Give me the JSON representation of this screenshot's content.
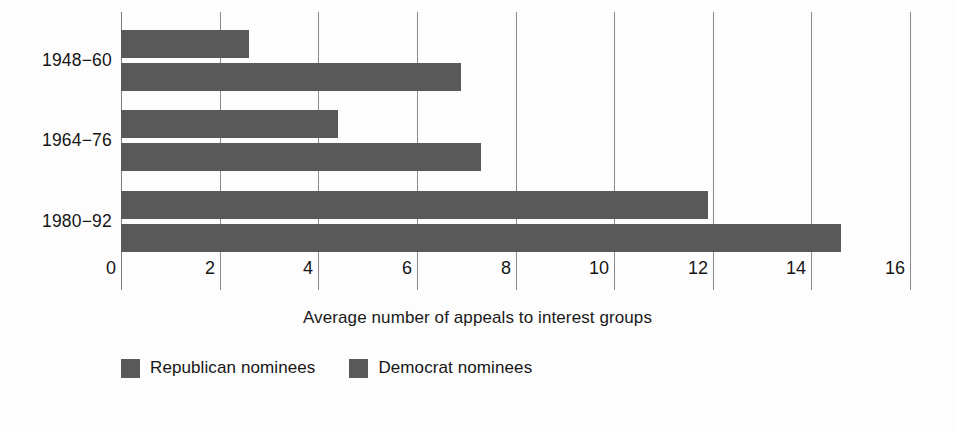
{
  "chart_data": {
    "type": "bar",
    "orientation": "horizontal",
    "title": "",
    "xlabel": "Average number of appeals to interest groups",
    "ylabel": "",
    "categories": [
      "1948−60",
      "1964−76",
      "1980−92"
    ],
    "series": [
      {
        "name": "Republican nominees",
        "values": [
          2.6,
          4.4,
          11.9
        ],
        "color": "#595959"
      },
      {
        "name": "Democrat nominees",
        "values": [
          6.9,
          7.3,
          14.6
        ],
        "color": "#595959"
      }
    ],
    "xlim": [
      0,
      16
    ],
    "xticks": [
      0,
      2,
      4,
      6,
      8,
      10,
      12,
      14,
      16
    ],
    "xtick_labels": [
      "0",
      "2",
      "4",
      "6",
      "8",
      "10",
      "12",
      "14",
      "16"
    ],
    "grid": true,
    "grid_axis": "x",
    "legend_position": "bottom-left",
    "legend": [
      "Republican nominees",
      "Democrat nominees"
    ],
    "background_color": "#fdfdfd",
    "gridline_color": "#8a8a8a"
  }
}
